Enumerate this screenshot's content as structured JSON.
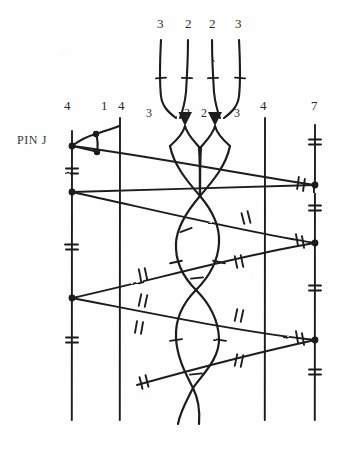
{
  "figure": {
    "kind": "hand-drawn-knot-braid-diagram",
    "caption_label": "PIN J",
    "ink_color": "#1c1c1c",
    "paper_color": "#fefefe",
    "width": 349,
    "height": 450
  },
  "top_labels": [
    {
      "text": "3",
      "x": 160,
      "y": 18
    },
    {
      "text": "2",
      "x": 188,
      "y": 18
    },
    {
      "text": "2",
      "x": 212,
      "y": 18
    },
    {
      "text": "3",
      "x": 238,
      "y": 18
    }
  ],
  "row_labels": [
    {
      "text": "4",
      "x": 65,
      "y": 100
    },
    {
      "text": "1",
      "x": 103,
      "y": 100
    },
    {
      "text": "4",
      "x": 120,
      "y": 100
    },
    {
      "text": "3",
      "x": 149,
      "y": 107
    },
    {
      "text": "2",
      "x": 186,
      "y": 107
    },
    {
      "text": "2",
      "x": 203,
      "y": 107
    },
    {
      "text": "3",
      "x": 236,
      "y": 107
    },
    {
      "text": "4",
      "x": 262,
      "y": 100
    },
    {
      "text": "7",
      "x": 313,
      "y": 100
    }
  ],
  "vertical_strands": [
    {
      "name": "strand-left-4",
      "x": 72,
      "y1": 131,
      "y2": 420
    },
    {
      "name": "strand-mid-4",
      "x": 120,
      "y1": 118,
      "y2": 420
    },
    {
      "name": "strand-right-4",
      "x": 265,
      "y1": 118,
      "y2": 420
    },
    {
      "name": "strand-far-7",
      "x": 315,
      "y1": 125,
      "y2": 420
    }
  ],
  "diagonals": [
    {
      "name": "diag-1",
      "x1": 72,
      "y1": 146,
      "x2": 315,
      "y2": 185
    },
    {
      "name": "diag-2",
      "x1": 72,
      "y1": 192,
      "x2": 315,
      "y2": 185
    },
    {
      "name": "diag-3",
      "x1": 72,
      "y1": 192,
      "x2": 315,
      "y2": 243
    },
    {
      "name": "diag-4",
      "x1": 72,
      "y1": 298,
      "x2": 315,
      "y2": 243
    },
    {
      "name": "diag-5",
      "x1": 72,
      "y1": 298,
      "x2": 315,
      "y2": 340
    },
    {
      "name": "diag-6",
      "x1": 137,
      "y1": 385,
      "x2": 315,
      "y2": 340
    }
  ],
  "junction_dots": [
    {
      "x": 72,
      "y": 146
    },
    {
      "x": 72,
      "y": 192
    },
    {
      "x": 72,
      "y": 298
    },
    {
      "x": 96,
      "y": 138
    },
    {
      "x": 96,
      "y": 150
    },
    {
      "x": 315,
      "y": 185
    },
    {
      "x": 315,
      "y": 243
    },
    {
      "x": 315,
      "y": 340
    }
  ],
  "tick_marks": {
    "description": "short perpendicular hatch strokes crossing strands",
    "count": 34
  },
  "top_arrows": [
    {
      "name": "arrow-left",
      "tip_x": 185,
      "tip_y": 124
    },
    {
      "name": "arrow-right",
      "tip_x": 215,
      "tip_y": 124
    }
  ],
  "braid": {
    "crossings": [
      {
        "x": 200,
        "y": 196
      },
      {
        "x": 196,
        "y": 290
      },
      {
        "x": 193,
        "y": 388
      }
    ],
    "lens_centers": [
      {
        "x": 197,
        "y": 243
      },
      {
        "x": 195,
        "y": 338
      }
    ]
  }
}
